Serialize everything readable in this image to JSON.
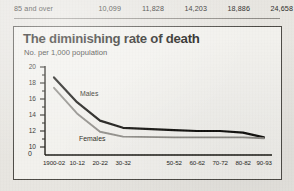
{
  "table": {
    "row_label": "85 and over",
    "values": [
      "10,099",
      "11,828",
      "14,203",
      "18,886",
      "24,658"
    ]
  },
  "chart": {
    "title": "The diminishing rate of death",
    "subtitle": "No. per 1,000 population",
    "axis_break_symbol": "0"
  },
  "chart_data": {
    "type": "line",
    "title": "The diminishing rate of death",
    "subtitle": "No. per 1,000 population",
    "xlabel": "",
    "ylabel": "No. per 1,000 population",
    "ylim": [
      9,
      20
    ],
    "yticks": [
      10,
      12,
      14,
      16,
      18,
      20
    ],
    "grid": false,
    "legend": "inline-labels",
    "axis_break": true,
    "note": "Period 40-42 omitted from the category axis",
    "categories": [
      "1900-02",
      "10-12",
      "20-22",
      "30-32",
      "50-52",
      "60-62",
      "70-72",
      "80-82",
      "90-93"
    ],
    "series": [
      {
        "name": "Males",
        "color": "#100f0c",
        "values": [
          18.7,
          15.6,
          13.3,
          12.4,
          12.1,
          12.0,
          12.0,
          11.8,
          11.2
        ]
      },
      {
        "name": "Females",
        "color": "#8d8b86",
        "values": [
          17.4,
          14.2,
          11.9,
          11.3,
          11.2,
          11.2,
          11.2,
          11.2,
          11.1
        ]
      }
    ]
  }
}
